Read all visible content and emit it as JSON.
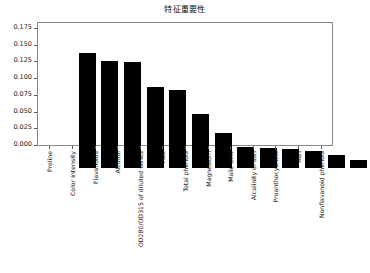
{
  "chart_data": {
    "type": "bar",
    "title": "特征重要性",
    "xlabel": "",
    "ylabel": "",
    "ylim": [
      0.0,
      0.1825
    ],
    "grid": false,
    "legend": null,
    "orientation": "vertical",
    "bar_color": "#000000",
    "categories": [
      "Proline",
      "Color intensity",
      "Flavanoids",
      "Alcohol",
      "OD280/OD315 of diluted wines",
      "Hue",
      "Total phenols",
      "Magnesium",
      "Malic acid",
      "Alcalinity of ash",
      "Proanthocyanins",
      "Ash",
      "Nonflavanoid phenols"
    ],
    "values": [
      0.172,
      0.16,
      0.158,
      0.121,
      0.116,
      0.081,
      0.052,
      0.031,
      0.03,
      0.029,
      0.025,
      0.02,
      0.012
    ],
    "yticks": [
      "0.000",
      "0.025",
      "0.050",
      "0.075",
      "0.100",
      "0.125",
      "0.150",
      "0.175"
    ],
    "ytick_values": [
      0.0,
      0.025,
      0.05,
      0.075,
      0.1,
      0.125,
      0.15,
      0.175
    ]
  }
}
